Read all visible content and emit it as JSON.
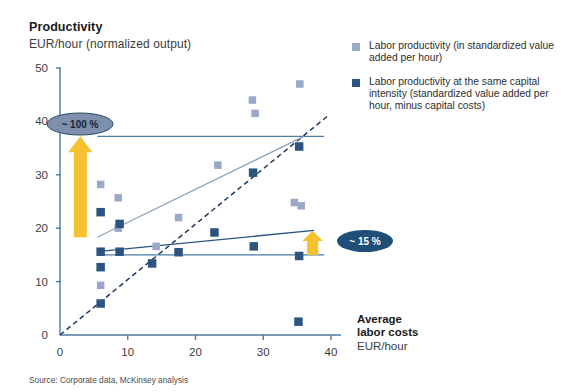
{
  "header": {
    "title": "Productivity",
    "subtitle": "EUR/hour (normalized output)"
  },
  "legend": {
    "position": "right",
    "items": [
      {
        "label": "Labor productivity (in standardized value added per hour)",
        "color": "#9aa9c9",
        "name": "legend-swatch-labor-productivity"
      },
      {
        "label": "Labor productivity at the same capital intensity (standardized value added per hour, minus capital costs)",
        "color": "#2b5580",
        "name": "legend-swatch-same-capital-intensity"
      }
    ]
  },
  "axis_titles": {
    "x_main_line1": "Average",
    "x_main_line2": "labor costs",
    "x_sub": "EUR/hour"
  },
  "annotations": [
    {
      "id": "gap-upper",
      "label": "~ 100 %",
      "fill": "#7d90ab",
      "text_color": "#15243a",
      "x": 80,
      "y": 124
    },
    {
      "id": "gap-lower",
      "label": "~ 15 %",
      "fill": "#1f4e79",
      "text_color": "#ffffff",
      "x": 365,
      "y": 241
    }
  ],
  "source": "Source:  Corporate data, McKinsey analysis",
  "colors": {
    "light_marker": "#9aa9c9",
    "dark_marker": "#2b5580",
    "axis": "#4a7ca5",
    "arrow": "#f5c12e",
    "trend_light": "#8fa3bd",
    "trend_dark": "#2b5580",
    "reference_line": "#4a7ca5",
    "diagonal": "#1f3a5f"
  },
  "chart_data": {
    "type": "scatter",
    "title": "Productivity",
    "subtitle": "EUR/hour (normalized output)",
    "xlabel": "Average labor costs EUR/hour",
    "ylabel": "Productivity EUR/hour (normalized output)",
    "xlim": [
      0,
      40
    ],
    "ylim": [
      0,
      50
    ],
    "xticks": [
      0,
      10,
      20,
      30,
      40
    ],
    "yticks": [
      0,
      10,
      20,
      30,
      40,
      50
    ],
    "grid": false,
    "series": [
      {
        "name": "Labor productivity (in standardized value added per hour)",
        "color": "#9aa9c9",
        "points": [
          {
            "x": 6.0,
            "y": 28.2
          },
          {
            "x": 6.0,
            "y": 9.3
          },
          {
            "x": 8.6,
            "y": 25.7
          },
          {
            "x": 8.6,
            "y": 20.0
          },
          {
            "x": 14.2,
            "y": 16.6
          },
          {
            "x": 17.5,
            "y": 22.0
          },
          {
            "x": 23.3,
            "y": 31.8
          },
          {
            "x": 28.4,
            "y": 44.0
          },
          {
            "x": 28.8,
            "y": 41.5
          },
          {
            "x": 34.6,
            "y": 24.8
          },
          {
            "x": 35.6,
            "y": 24.2
          },
          {
            "x": 35.4,
            "y": 47.0
          }
        ]
      },
      {
        "name": "Labor productivity at the same capital intensity (standardized value added per hour, minus capital costs)",
        "color": "#2b5580",
        "points": [
          {
            "x": 6.0,
            "y": 23.0
          },
          {
            "x": 6.0,
            "y": 15.6
          },
          {
            "x": 6.0,
            "y": 12.7
          },
          {
            "x": 6.0,
            "y": 5.9
          },
          {
            "x": 8.8,
            "y": 20.8
          },
          {
            "x": 8.8,
            "y": 15.6
          },
          {
            "x": 13.6,
            "y": 13.4
          },
          {
            "x": 17.5,
            "y": 15.5
          },
          {
            "x": 22.8,
            "y": 19.2
          },
          {
            "x": 28.5,
            "y": 30.4
          },
          {
            "x": 28.6,
            "y": 16.6
          },
          {
            "x": 35.3,
            "y": 35.3
          },
          {
            "x": 35.3,
            "y": 14.8
          },
          {
            "x": 35.2,
            "y": 2.5
          }
        ]
      }
    ],
    "trend_lines": [
      {
        "name": "light-trend",
        "color": "#8fa3bd",
        "x1": 5.5,
        "y1": 18.3,
        "x2": 36.0,
        "y2": 37.2
      },
      {
        "name": "dark-trend",
        "color": "#2b5580",
        "x1": 5.5,
        "y1": 15.6,
        "x2": 37.5,
        "y2": 19.6
      }
    ],
    "reference_lines": [
      {
        "name": "upper-reference",
        "color": "#4a7ca5",
        "y": 37.2,
        "x1": 5.5,
        "x2": 39.0
      },
      {
        "name": "lower-reference",
        "color": "#4a7ca5",
        "y": 15.0,
        "x1": 5.5,
        "x2": 39.0
      }
    ],
    "diagonal": {
      "name": "parity-line",
      "color": "#1f3a5f",
      "dashed": true,
      "x1": 0,
      "y1": 0,
      "x2": 39.5,
      "y2": 41.0
    },
    "gap_arrows": [
      {
        "name": "upper-gap-arrow",
        "color": "#f5c12e",
        "x": 3.0,
        "y_from": 18.3,
        "y_to": 37.2,
        "label": "~ 100 %"
      },
      {
        "name": "lower-gap-arrow",
        "color": "#f5c12e",
        "x": 37.3,
        "y_from": 15.0,
        "y_to": 19.5,
        "label": "~ 15 %"
      }
    ]
  }
}
